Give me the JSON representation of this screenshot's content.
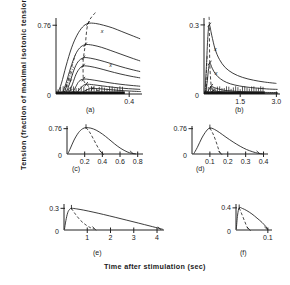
{
  "figure": {
    "ylabel": "Tension (fraction of maximal isotonic tension)",
    "xlabel": "Time after stimulation (sec)"
  },
  "chart_data": [
    {
      "type": "line",
      "panel": "(a)",
      "title": "",
      "xlabel": "Time after stimulation (sec)",
      "ylabel": "Tension (fraction of maximal isotonic tension)",
      "xlim": [
        0,
        0.47
      ],
      "ylim": [
        0,
        0.84
      ],
      "xticks": [
        0.4
      ],
      "xtick_labels": [
        "0.4"
      ],
      "yticks": [
        0,
        0.76
      ],
      "ytick_labels": [
        "0",
        "0.76"
      ],
      "grid": false,
      "legend": "none",
      "annotations": [
        "x",
        "x"
      ],
      "peak_locus_dashed": true,
      "series": [
        {
          "name": "curve-1",
          "peak_x": 0.175,
          "peak_y": 0.78,
          "x": [
            0.01,
            0.03,
            0.055,
            0.085,
            0.115,
            0.145,
            0.175,
            0.215,
            0.26,
            0.31,
            0.36,
            0.41,
            0.46
          ],
          "values": [
            0.01,
            0.12,
            0.31,
            0.51,
            0.65,
            0.74,
            0.78,
            0.78,
            0.76,
            0.73,
            0.69,
            0.65,
            0.61
          ]
        },
        {
          "name": "curve-2",
          "peak_x": 0.16,
          "peak_y": 0.545,
          "x": [
            0.035,
            0.055,
            0.08,
            0.105,
            0.13,
            0.16,
            0.2,
            0.25,
            0.3,
            0.355,
            0.41,
            0.46
          ],
          "values": [
            0.01,
            0.12,
            0.29,
            0.43,
            0.51,
            0.545,
            0.54,
            0.515,
            0.48,
            0.44,
            0.4,
            0.365
          ]
        },
        {
          "name": "curve-3",
          "peak_x": 0.15,
          "peak_y": 0.4,
          "x": [
            0.055,
            0.075,
            0.098,
            0.12,
            0.15,
            0.19,
            0.24,
            0.295,
            0.35,
            0.41,
            0.46
          ],
          "values": [
            0.01,
            0.12,
            0.265,
            0.355,
            0.4,
            0.395,
            0.372,
            0.34,
            0.305,
            0.272,
            0.248
          ]
        },
        {
          "name": "curve-4",
          "peak_x": 0.148,
          "peak_y": 0.31,
          "x": [
            0.07,
            0.09,
            0.11,
            0.13,
            0.148,
            0.185,
            0.235,
            0.29,
            0.35,
            0.41,
            0.46
          ],
          "values": [
            0.01,
            0.11,
            0.22,
            0.285,
            0.31,
            0.305,
            0.283,
            0.253,
            0.222,
            0.196,
            0.178
          ]
        },
        {
          "name": "curve-5",
          "peak_x": 0.15,
          "peak_y": 0.165,
          "x": [
            0.09,
            0.108,
            0.126,
            0.15,
            0.185,
            0.235,
            0.29,
            0.35,
            0.41,
            0.46
          ],
          "values": [
            0.008,
            0.08,
            0.14,
            0.165,
            0.16,
            0.144,
            0.125,
            0.108,
            0.095,
            0.086
          ]
        },
        {
          "name": "curve-6",
          "peak_x": 0.165,
          "peak_y": 0.108,
          "x": [
            0.11,
            0.13,
            0.148,
            0.165,
            0.205,
            0.255,
            0.31,
            0.37,
            0.42,
            0.46
          ],
          "values": [
            0.006,
            0.055,
            0.092,
            0.108,
            0.102,
            0.089,
            0.075,
            0.063,
            0.056,
            0.051
          ]
        },
        {
          "name": "curve-7",
          "peak_x": 0.2,
          "peak_y": 0.062,
          "x": [
            0.135,
            0.155,
            0.178,
            0.2,
            0.24,
            0.29,
            0.345,
            0.4,
            0.45,
            0.465
          ],
          "values": [
            0.004,
            0.032,
            0.054,
            0.062,
            0.058,
            0.049,
            0.04,
            0.033,
            0.028,
            0.027
          ]
        }
      ]
    },
    {
      "type": "line",
      "panel": "(b)",
      "title": "",
      "xlim": [
        0,
        3.15
      ],
      "ylim": [
        0,
        0.33
      ],
      "xticks": [
        1.5,
        3.0
      ],
      "xtick_labels": [
        "1.5",
        "3.0"
      ],
      "yticks": [
        0,
        0.3
      ],
      "ytick_labels": [
        "0",
        "0.3"
      ],
      "grid": false,
      "legend": "none",
      "annotations": [
        "x",
        "x"
      ],
      "peak_locus_dashed": true,
      "series": [
        {
          "name": "curve-1",
          "peak_x": 0.22,
          "peak_y": 0.3,
          "x": [
            0.04,
            0.1,
            0.16,
            0.22,
            0.32,
            0.46,
            0.64,
            0.88,
            1.2,
            1.6,
            2.05,
            2.5,
            3.0
          ],
          "values": [
            0.01,
            0.12,
            0.25,
            0.3,
            0.255,
            0.195,
            0.15,
            0.115,
            0.09,
            0.072,
            0.06,
            0.052,
            0.046
          ]
        },
        {
          "name": "curve-2",
          "peak_x": 0.24,
          "peak_y": 0.135,
          "x": [
            0.08,
            0.14,
            0.19,
            0.24,
            0.34,
            0.48,
            0.68,
            0.94,
            1.28,
            1.7,
            2.15,
            2.6,
            3.05
          ],
          "values": [
            0.008,
            0.06,
            0.11,
            0.135,
            0.112,
            0.086,
            0.066,
            0.05,
            0.039,
            0.031,
            0.026,
            0.022,
            0.02
          ]
        },
        {
          "name": "curve-3",
          "peak_x": 0.3,
          "peak_y": 0.034,
          "x": [
            0.14,
            0.2,
            0.26,
            0.3,
            0.42,
            0.6,
            0.85,
            1.15,
            1.55,
            2.0,
            2.5,
            3.05
          ],
          "values": [
            0.004,
            0.018,
            0.029,
            0.034,
            0.028,
            0.022,
            0.016,
            0.013,
            0.01,
            0.008,
            0.007,
            0.006
          ]
        },
        {
          "name": "curve-4",
          "peak_x": 0.38,
          "peak_y": 0.014,
          "x": [
            0.2,
            0.28,
            0.34,
            0.38,
            0.52,
            0.75,
            1.05,
            1.45,
            1.95,
            2.5,
            3.08
          ],
          "values": [
            0.002,
            0.008,
            0.012,
            0.014,
            0.012,
            0.009,
            0.007,
            0.005,
            0.004,
            0.003,
            0.003
          ]
        }
      ]
    },
    {
      "type": "line",
      "panel": "(c)",
      "title": "",
      "xlim": [
        0,
        0.86
      ],
      "ylim": [
        0,
        0.84
      ],
      "xticks": [
        0.2,
        0.4,
        0.6,
        0.8
      ],
      "xtick_labels": [
        "0.2",
        "0.4",
        "0.6",
        "0.8"
      ],
      "yticks": [
        0,
        0.76
      ],
      "ytick_labels": [
        "0",
        "0.76"
      ],
      "grid": false,
      "legend": "none",
      "peak_locus_dashed": true,
      "series": [
        {
          "name": "curve-1",
          "peak_x": 0.215,
          "peak_y": 0.79,
          "x": [
            0.01,
            0.04,
            0.08,
            0.13,
            0.175,
            0.215,
            0.27,
            0.33,
            0.4,
            0.47,
            0.54,
            0.61,
            0.68,
            0.73,
            0.78
          ],
          "values": [
            0.01,
            0.18,
            0.42,
            0.64,
            0.755,
            0.79,
            0.775,
            0.715,
            0.6,
            0.455,
            0.3,
            0.165,
            0.065,
            0.022,
            0.004
          ]
        }
      ],
      "dashed_descent": {
        "x": [
          0.215,
          0.255,
          0.295,
          0.335,
          0.37,
          0.395
        ],
        "values": [
          0.79,
          0.66,
          0.47,
          0.27,
          0.11,
          0.02
        ]
      }
    },
    {
      "type": "line",
      "panel": "(d)",
      "title": "",
      "xlim": [
        0,
        0.425
      ],
      "ylim": [
        0,
        0.84
      ],
      "xticks": [
        0.1,
        0.2,
        0.3,
        0.4
      ],
      "xtick_labels": [
        "0.1",
        "0.2",
        "0.3",
        "0.4"
      ],
      "yticks": [
        0,
        0.76
      ],
      "ytick_labels": [
        "0",
        "0.76"
      ],
      "grid": false,
      "legend": "none",
      "peak_locus_dashed": true,
      "series": [
        {
          "name": "curve-1",
          "peak_x": 0.1,
          "peak_y": 0.78,
          "x": [
            0.01,
            0.03,
            0.055,
            0.08,
            0.1,
            0.125,
            0.155,
            0.19,
            0.23,
            0.27,
            0.305,
            0.34,
            0.37,
            0.395
          ],
          "values": [
            0.008,
            0.2,
            0.48,
            0.69,
            0.78,
            0.74,
            0.64,
            0.505,
            0.36,
            0.23,
            0.135,
            0.065,
            0.022,
            0.004
          ]
        }
      ],
      "dashed_descent": {
        "x": [
          0.1,
          0.118,
          0.134,
          0.148,
          0.158
        ],
        "values": [
          0.78,
          0.6,
          0.38,
          0.15,
          0.02
        ]
      }
    },
    {
      "type": "line",
      "panel": "(e)",
      "title": "",
      "xlim": [
        0,
        4.3
      ],
      "ylim": [
        0,
        0.36
      ],
      "xticks": [
        1,
        2,
        3,
        4
      ],
      "xtick_labels": [
        "1",
        "2",
        "3",
        "4"
      ],
      "yticks": [
        0,
        0.3
      ],
      "ytick_labels": [
        "0",
        "0.3"
      ],
      "grid": false,
      "legend": "none",
      "peak_locus_dashed": true,
      "series": [
        {
          "name": "curve-1",
          "peak_x": 0.32,
          "peak_y": 0.3,
          "x": [
            0.02,
            0.08,
            0.16,
            0.24,
            0.32,
            0.55,
            0.85,
            1.25,
            1.7,
            2.2,
            2.7,
            3.2,
            3.7,
            4.1,
            4.25
          ],
          "values": [
            0.01,
            0.13,
            0.24,
            0.285,
            0.3,
            0.292,
            0.275,
            0.248,
            0.215,
            0.176,
            0.136,
            0.096,
            0.055,
            0.022,
            0.01
          ]
        }
      ],
      "dashed_descent": {
        "x": [
          0.32,
          0.5,
          0.72,
          0.95,
          1.15,
          1.3
        ],
        "values": [
          0.3,
          0.215,
          0.13,
          0.068,
          0.03,
          0.015
        ]
      }
    },
    {
      "type": "line",
      "panel": "(f)",
      "title": "",
      "xlim": [
        0,
        0.113
      ],
      "ylim": [
        0,
        0.47
      ],
      "xticks": [
        0.1
      ],
      "xtick_labels": [
        "0.1"
      ],
      "yticks": [
        0,
        0.4
      ],
      "ytick_labels": [
        "0",
        "0.4"
      ],
      "grid": false,
      "legend": "none",
      "peak_locus_dashed": true,
      "series": [
        {
          "name": "curve-1",
          "peak_x": 0.01,
          "peak_y": 0.4,
          "x": [
            0.001,
            0.005,
            0.01,
            0.02,
            0.034,
            0.05,
            0.066,
            0.082,
            0.094,
            0.1
          ],
          "values": [
            0.02,
            0.27,
            0.4,
            0.39,
            0.35,
            0.29,
            0.215,
            0.135,
            0.06,
            0.01
          ]
        }
      ],
      "dashed_descent": {
        "x": [
          0.01,
          0.018,
          0.027,
          0.035,
          0.04
        ],
        "values": [
          0.4,
          0.29,
          0.16,
          0.05,
          0.012
        ]
      }
    }
  ]
}
